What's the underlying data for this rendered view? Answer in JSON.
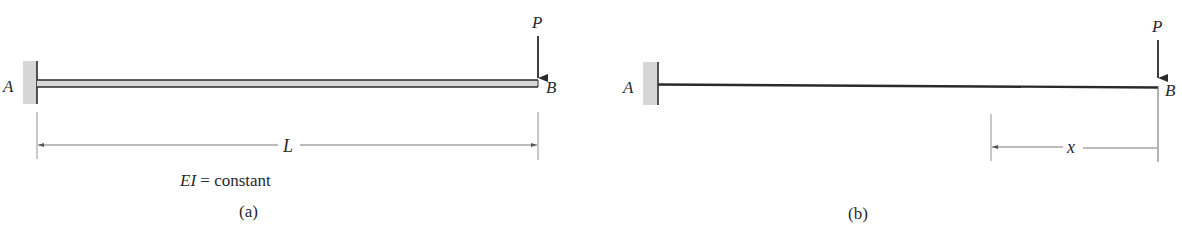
{
  "figure_a": {
    "support_label": "A",
    "end_label": "B",
    "load_label": "P",
    "length_label": "L",
    "stiffness_label_var": "EI",
    "stiffness_label_rest": " = constant",
    "caption": "(a)"
  },
  "figure_b": {
    "support_label": "A",
    "end_label": "B",
    "load_label": "P",
    "distance_label": "x",
    "caption": "(b)"
  },
  "colors": {
    "line": "#2a2a2a",
    "wall_fill": "#d6d6d6",
    "beam_fill": "#d9d9d9",
    "dim_line": "#555555"
  }
}
